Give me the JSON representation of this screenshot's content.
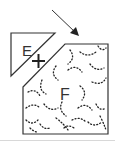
{
  "diagram": {
    "piece_e": {
      "label": "E",
      "shape": "right-triangle"
    },
    "piece_f": {
      "label": "F",
      "shape": "chamfered-square",
      "pattern": "dotted-arcs"
    },
    "join_symbol": "+",
    "arrow": {
      "icon": "arrow-down-right-icon"
    },
    "colors": {
      "stroke": "#333333",
      "dots": "#222222",
      "fill": "#ffffff",
      "baseline": "#d8d8d8"
    }
  }
}
